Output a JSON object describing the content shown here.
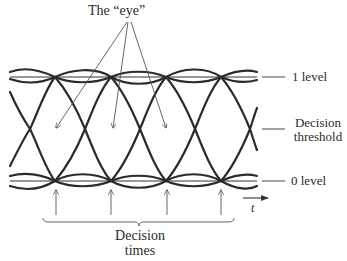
{
  "figure": {
    "type": "eye-diagram",
    "labels": {
      "eye": "The “eye”",
      "one_level": "1 level",
      "threshold_line1": "Decision",
      "threshold_line2": "threshold",
      "zero_level": "0 level",
      "time_axis": "t",
      "decision_times_line1": "Decision",
      "decision_times_line2": "times"
    },
    "levels": {
      "one_level_y": 77,
      "threshold_y": 129,
      "zero_level_y": 181
    },
    "decision_time_x": [
      55,
      111,
      166,
      221
    ],
    "threshold_crossing_x": [
      30,
      85,
      140,
      195,
      250
    ],
    "eye_arrow_targets": [
      [
        55,
        130
      ],
      [
        112,
        128
      ],
      [
        166,
        128
      ]
    ],
    "colors": {
      "trace": "#2b2b2b",
      "annotation": "#555555",
      "background": "#ffffff"
    }
  }
}
